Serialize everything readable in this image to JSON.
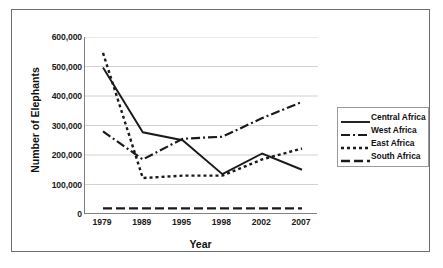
{
  "chart_data": {
    "type": "line",
    "title": "",
    "xlabel": "Year",
    "ylabel": "Number of Elephants",
    "categories": [
      "1979",
      "1989",
      "1995",
      "1998",
      "2002",
      "2007"
    ],
    "x": [
      1979,
      1989,
      1995,
      1998,
      2002,
      2007
    ],
    "ylim": [
      0,
      600000
    ],
    "yticks": [
      "0",
      "100,000",
      "200,000",
      "300,000",
      "400,000",
      "500,000",
      "600,000"
    ],
    "ytick_values": [
      0,
      100000,
      200000,
      300000,
      400000,
      500000,
      600000
    ],
    "grid": "horizontal",
    "legend_position": "right",
    "series": [
      {
        "name": "Central Africa",
        "style": "solid",
        "color": "#1a1a1a",
        "values": [
          497000,
          277000,
          250000,
          135000,
          205000,
          150000
        ]
      },
      {
        "name": "West Africa",
        "style": "dash-dot",
        "color": "#1a1a1a",
        "values": [
          280000,
          185000,
          255000,
          262000,
          325000,
          380000
        ]
      },
      {
        "name": "East Africa",
        "style": "dotted",
        "color": "#1a1a1a",
        "values": [
          546000,
          122000,
          130000,
          130000,
          185000,
          222000
        ]
      },
      {
        "name": "South Africa",
        "style": "long-dash",
        "color": "#1a1a1a",
        "values": [
          19000,
          19000,
          19000,
          19000,
          19000,
          19000
        ]
      }
    ]
  },
  "axes": {
    "x_title": "Year",
    "y_title": "Number of Elephants"
  },
  "legend": {
    "entries": [
      {
        "label": "Central Africa",
        "style": "solid"
      },
      {
        "label": "West Africa",
        "style": "dash-dot"
      },
      {
        "label": "East Africa",
        "style": "dotted"
      },
      {
        "label": "South Africa",
        "style": "long-dash"
      }
    ]
  },
  "colors": {
    "line": "#1a1a1a",
    "grid": "#d2d2d2",
    "axis": "#808080",
    "frame": "#6e6e6e",
    "background": "#ffffff"
  }
}
